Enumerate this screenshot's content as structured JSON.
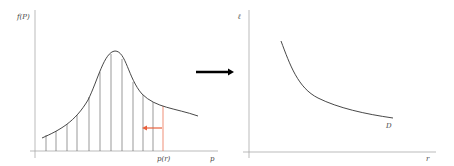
{
  "left_plot": {
    "y_label": "f(P)",
    "x_label": "p",
    "marker_label": "p(r)",
    "curve_color": "#333333",
    "highlight_color": "#e8603c",
    "hatch_x": [
      46,
      56,
      67,
      77,
      89,
      100,
      111,
      122,
      133,
      143,
      153,
      163
    ]
  },
  "transition_arrow": {
    "color": "#000000"
  },
  "right_plot": {
    "y_label": "ℓ",
    "x_label": "r",
    "curve_label": "D"
  }
}
